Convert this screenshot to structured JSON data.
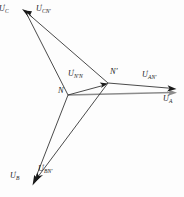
{
  "figure": {
    "type": "phasor-diagram",
    "title": "",
    "background_color": "#fdfdfd",
    "line_color": "#2b2b2b",
    "highlight_line_color": "#8c8c8c",
    "width": 184,
    "height": 197
  },
  "nodes": [
    {
      "id": "N",
      "label": "N",
      "x": 68,
      "y": 95,
      "label_x": 60,
      "label_y": 90
    },
    {
      "id": "Np",
      "label": "N′",
      "x": 108,
      "y": 83,
      "label_x": 110,
      "label_y": 68
    }
  ],
  "vectors": [
    {
      "id": "UC",
      "label_main": "U",
      "label_sub": "C",
      "from": "N",
      "from_x": 68,
      "from_y": 95,
      "to_x": 22,
      "to_y": 10,
      "color": "#2b2b2b",
      "label_x": 2,
      "label_y": 5
    },
    {
      "id": "UCNp",
      "label_main": "U",
      "label_sub": "CN′",
      "from": "Np",
      "from_x": 108,
      "from_y": 83,
      "to_x": 25,
      "to_y": 11,
      "color": "#2b2b2b",
      "label_x": 39,
      "label_y": 5
    },
    {
      "id": "UB",
      "label_main": "U",
      "label_sub": "B",
      "from": "N",
      "from_x": 68,
      "from_y": 95,
      "to_x": 33,
      "to_y": 183,
      "color": "#2b2b2b",
      "label_x": 13,
      "label_y": 172
    },
    {
      "id": "UBNp",
      "label_main": "U",
      "label_sub": "BN′",
      "from": "Np",
      "from_x": 108,
      "from_y": 83,
      "to_x": 36,
      "to_y": 182,
      "color": "#2b2b2b",
      "label_x": 41,
      "label_y": 165
    },
    {
      "id": "UA",
      "label_main": "U",
      "label_sub": "A",
      "from": "N",
      "from_x": 68,
      "from_y": 95,
      "to_x": 177,
      "to_y": 93,
      "color": "#8c8c8c",
      "label_x": 166,
      "label_y": 95
    },
    {
      "id": "UANp",
      "label_main": "U",
      "label_sub": "AN′",
      "from": "Np",
      "from_x": 108,
      "from_y": 83,
      "to_x": 176,
      "to_y": 89,
      "color": "#2b2b2b",
      "label_x": 145,
      "label_y": 71
    },
    {
      "id": "UNpN",
      "label_main": "U",
      "label_sub": "N′N",
      "from": "N",
      "from_x": 68,
      "from_y": 95,
      "to_x": 107,
      "to_y": 84,
      "color": "#2b2b2b",
      "label_x": 71,
      "label_y": 70
    }
  ]
}
